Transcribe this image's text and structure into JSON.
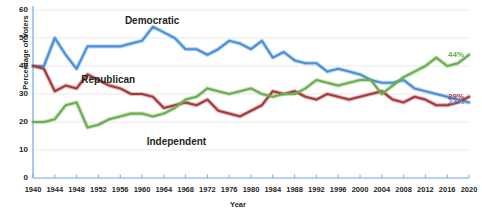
{
  "chart_data": {
    "type": "line",
    "title": "",
    "xlabel": "Year",
    "ylabel": "Percentage of Voters",
    "xlim": [
      1940,
      2020
    ],
    "ylim": [
      0,
      60
    ],
    "yticks": [
      0,
      10,
      20,
      30,
      40,
      50,
      60
    ],
    "xticks": [
      1940,
      1944,
      1948,
      1952,
      1956,
      1960,
      1964,
      1968,
      1972,
      1976,
      1980,
      1984,
      1988,
      1992,
      1996,
      2000,
      2004,
      2008,
      2012,
      2016,
      2020
    ],
    "grid": true,
    "legend_position": "inline-annotations",
    "annotations": [
      {
        "text": "Democratic",
        "series": "Democratic",
        "x": 1962,
        "y": 56
      },
      {
        "text": "Republican",
        "series": "Republican",
        "x": 1954,
        "y": 35
      },
      {
        "text": "Independent",
        "series": "Independent",
        "x": 1966,
        "y": 13
      },
      {
        "text": "44%",
        "series": "Independent",
        "x": 2020,
        "y": 44
      },
      {
        "text": "29%",
        "series": "Republican",
        "x": 2020,
        "y": 29
      },
      {
        "text": "27%",
        "series": "Democratic",
        "x": 2020,
        "y": 27
      }
    ],
    "series": [
      {
        "name": "Democratic",
        "color": "#4a90d9",
        "end_value_label": "44%",
        "x": [
          1940,
          1942,
          1944,
          1946,
          1948,
          1950,
          1952,
          1954,
          1956,
          1958,
          1960,
          1962,
          1964,
          1966,
          1968,
          1970,
          1972,
          1974,
          1976,
          1978,
          1980,
          1982,
          1984,
          1986,
          1988,
          1990,
          1992,
          1994,
          1996,
          1998,
          2000,
          2002,
          2004,
          2006,
          2008,
          2010,
          2012,
          2014,
          2016,
          2018,
          2020
        ],
        "values": [
          40,
          40,
          50,
          44,
          39,
          47,
          47,
          47,
          47,
          48,
          49,
          54,
          52,
          50,
          46,
          46,
          44,
          46,
          49,
          48,
          46,
          49,
          43,
          45,
          42,
          41,
          41,
          38,
          39,
          38,
          37,
          35,
          34,
          34,
          35,
          32,
          31,
          30,
          29,
          28,
          27
        ]
      },
      {
        "name": "Republican",
        "color": "#a8383b",
        "end_value_label": "29%",
        "x": [
          1940,
          1942,
          1944,
          1946,
          1948,
          1950,
          1952,
          1954,
          1956,
          1958,
          1960,
          1962,
          1964,
          1966,
          1968,
          1970,
          1972,
          1974,
          1976,
          1978,
          1980,
          1982,
          1984,
          1986,
          1988,
          1990,
          1992,
          1994,
          1996,
          1998,
          2000,
          2002,
          2004,
          2006,
          2008,
          2010,
          2012,
          2014,
          2016,
          2018,
          2020
        ],
        "values": [
          40,
          39,
          31,
          33,
          32,
          37,
          35,
          33,
          32,
          30,
          30,
          29,
          25,
          26,
          27,
          26,
          28,
          24,
          23,
          22,
          24,
          26,
          31,
          30,
          31,
          29,
          28,
          30,
          29,
          28,
          29,
          30,
          31,
          28,
          27,
          29,
          28,
          26,
          26,
          27,
          29
        ]
      },
      {
        "name": "Independent",
        "color": "#6aaf4b",
        "end_value_label": "27%",
        "x": [
          1940,
          1942,
          1944,
          1946,
          1948,
          1950,
          1952,
          1954,
          1956,
          1958,
          1960,
          1962,
          1964,
          1966,
          1968,
          1970,
          1972,
          1974,
          1976,
          1978,
          1980,
          1982,
          1984,
          1986,
          1988,
          1990,
          1992,
          1994,
          1996,
          1998,
          2000,
          2002,
          2004,
          2006,
          2008,
          2010,
          2012,
          2014,
          2016,
          2018,
          2020
        ],
        "values": [
          20,
          20,
          21,
          26,
          27,
          18,
          19,
          21,
          22,
          23,
          23,
          22,
          23,
          25,
          28,
          29,
          32,
          31,
          30,
          31,
          32,
          30,
          29,
          30,
          30,
          32,
          35,
          34,
          33,
          34,
          35,
          35,
          30,
          33,
          36,
          38,
          40,
          43,
          40,
          41,
          44
        ]
      }
    ]
  },
  "axis": {
    "y_title": "Percentage of Voters",
    "x_title": "Year"
  }
}
